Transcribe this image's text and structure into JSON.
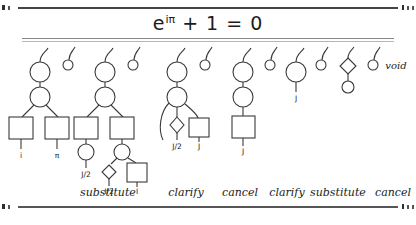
{
  "title": {
    "base": "e",
    "exponent": "iπ",
    "rest": " + 1 = 0",
    "full": "e^{iπ} + 1 = 0"
  },
  "void_label": "void",
  "trees": [
    {
      "name": "tree-1",
      "labels": [
        "i",
        "π"
      ]
    },
    {
      "name": "tree-2",
      "labels": [
        "J/2",
        "J/2",
        "J"
      ]
    },
    {
      "name": "tree-3",
      "labels": [
        "J/2",
        "J"
      ]
    },
    {
      "name": "tree-4",
      "labels": [
        "J"
      ]
    },
    {
      "name": "tree-5",
      "labels": [
        "J"
      ]
    },
    {
      "name": "tree-6",
      "labels": []
    }
  ],
  "captions": [
    {
      "text": "substitute",
      "x": 108
    },
    {
      "text": "clarify",
      "x": 186
    },
    {
      "text": "cancel",
      "x": 240
    },
    {
      "text": "clarify",
      "x": 286
    },
    {
      "text": "substitute",
      "x": 337
    },
    {
      "text": "cancel",
      "x": 392
    }
  ],
  "labels": {
    "t1_left": "i",
    "t1_right": "π",
    "t2_left": "J/2",
    "t2_mid": "J/2",
    "t2_right": "J",
    "t3_left": "J/2",
    "t3_right": "J",
    "t4": "J",
    "t5": "J"
  },
  "colors": {
    "background": "#ffffff",
    "ink": "#3a3a3a",
    "text": "#1b1b1b",
    "rule": "#444444",
    "rule_light": "#b5b5b5"
  }
}
